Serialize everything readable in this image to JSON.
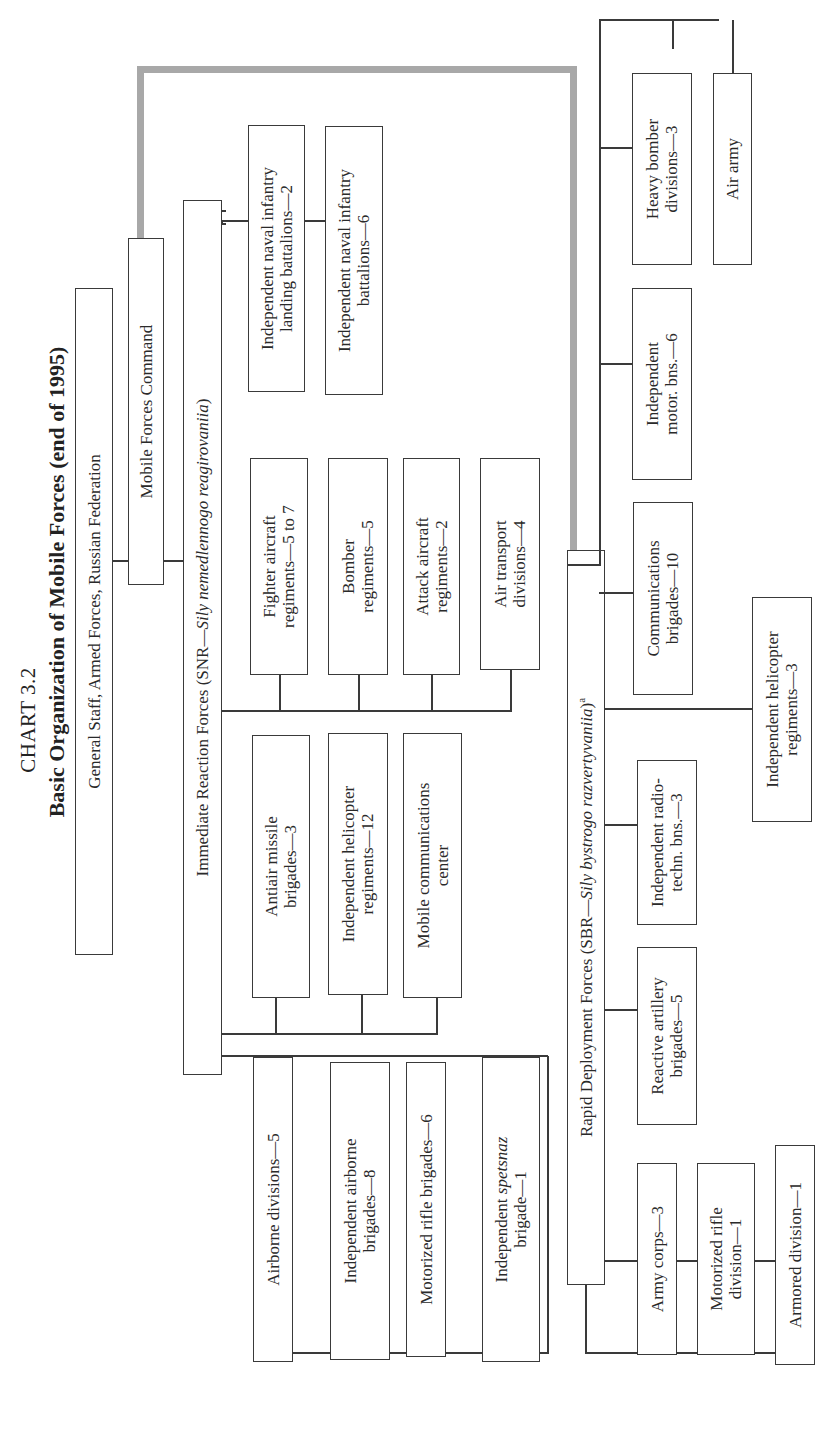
{
  "header": {
    "chart_label": "CHART 3.2",
    "title": "Basic Organization of Mobile Forces (end of 1995)"
  },
  "top": {
    "general_staff": "General Staff, Armed Forces, Russian Federation",
    "mobile_forces_command": "Mobile Forces Command"
  },
  "snr": {
    "name": "Immediate Reaction Forces (SNR—",
    "russian": "Sily nemedlennogo reagirovaniia",
    "close": ")",
    "ground_units": [
      {
        "line1": "Airborne divisions—5",
        "line2": ""
      },
      {
        "line1": "Independent  airborne",
        "line2": "brigades—8"
      },
      {
        "line1": "Motorized rifle brigades—6",
        "line2": ""
      },
      {
        "line1_pre": "Independent ",
        "line1_italic": "spetsnaz",
        "line2": "brigade—1"
      }
    ],
    "support_units": [
      {
        "line1": "Antiair missile",
        "line2": "brigades—3"
      },
      {
        "line1": "Independent helicopter",
        "line2": "regiments—12"
      },
      {
        "line1": "Mobile communications",
        "line2": "center"
      }
    ],
    "air_units": [
      {
        "line1": "Fighter aircraft",
        "line2": "regiments—5 to 7"
      },
      {
        "line1": "Bomber",
        "line2": "regiments—5"
      },
      {
        "line1": "Attack aircraft",
        "line2": "regiments—2"
      },
      {
        "line1": "Air transport",
        "line2": "divisions—4"
      }
    ],
    "naval_units": [
      {
        "line1": "Independent naval infantry",
        "line2": "landing battalions—2"
      },
      {
        "line1": "Independent naval infantry",
        "line2": "battalions—6"
      }
    ]
  },
  "sbr": {
    "name": "Rapid Deployment Forces (SBR—",
    "russian": "Sily bystrogo razvertyvaniia",
    "close": ")",
    "footnote_mark": "a",
    "ground_units": [
      {
        "line1": "Army corps—3",
        "line2": ""
      },
      {
        "line1": "Motorized rifle",
        "line2": "division—1"
      },
      {
        "line1": "Armored division—1",
        "line2": ""
      }
    ],
    "artillery": {
      "line1": "Reactive artillery",
      "line2": "brigades—5"
    },
    "radio": {
      "line1": "Independent radio-",
      "line2": "techn. bns.—3"
    },
    "helicopter": {
      "line1": "Independent helicopter",
      "line2": "regiments—3"
    },
    "communications": {
      "line1": "Communications",
      "line2": "brigades—10"
    },
    "motor": {
      "line1": "Independent",
      "line2": "motor. bns.—6"
    },
    "heavy_bomber": {
      "line1": "Heavy bomber",
      "line2": "divisions—3"
    },
    "air_army": {
      "line1": "Air army",
      "line2": ""
    }
  },
  "colors": {
    "line": "#3a3a3a",
    "command_link": "#a8a8a8",
    "text": "#2a2a2a"
  }
}
